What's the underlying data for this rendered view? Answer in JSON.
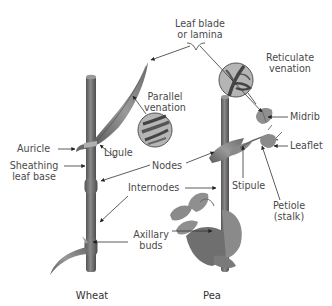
{
  "diagram": {
    "colors": {
      "stem": "#6e6e6e",
      "leaf": "#8a8a8a",
      "leaf_dark": "#5f5f5f",
      "line": "#333333",
      "text": "#4a4a4a",
      "background": "#ffffff"
    },
    "labels": {
      "leaf_blade_line1": "Leaf blade",
      "leaf_blade_line2": "or lamina",
      "reticulate_line1": "Reticulate",
      "reticulate_line2": "venation",
      "parallel_line1": "Parallel",
      "parallel_line2": "venation",
      "midrib": "Midrib",
      "auricle": "Auricle",
      "ligule": "Ligule",
      "leaflet": "Leaflet",
      "sheathing_line1": "Sheathing",
      "sheathing_line2": "leaf base",
      "nodes": "Nodes",
      "stipule": "Stipule",
      "petiole_line1": "Petiole",
      "petiole_line2": "(stalk)",
      "internodes": "Internodes",
      "axillary_line1": "Axillary",
      "axillary_line2": "buds"
    },
    "plants": [
      {
        "name": "Wheat",
        "type": "monocot"
      },
      {
        "name": "Pea",
        "type": "dicot"
      }
    ]
  }
}
